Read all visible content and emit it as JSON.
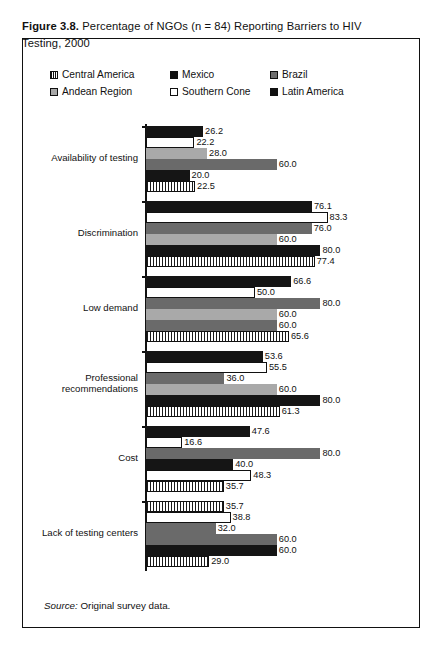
{
  "figure": {
    "number": "Figure 3.8.",
    "caption": "Percentage of NGOs (n = 84) Reporting Barriers to HIV Testing, 2000",
    "source_label": "Source:",
    "source_text": "Original survey data."
  },
  "legend": {
    "items": [
      {
        "label": "Central America",
        "swatch": "striped-vertical",
        "color": "#1a1a1a"
      },
      {
        "label": "Mexico",
        "swatch": "solid-black",
        "color": "#151515"
      },
      {
        "label": "Brazil",
        "swatch": "solid-dark-gray",
        "color": "#6a6a6a"
      },
      {
        "label": "Andean Region",
        "swatch": "solid-light-gray",
        "color": "#a9a9a9"
      },
      {
        "label": "Southern Cone",
        "swatch": "solid-white",
        "color": "#ffffff"
      },
      {
        "label": "Latin America",
        "swatch": "solid-black",
        "color": "#151515"
      }
    ]
  },
  "chart_data": {
    "type": "bar",
    "orientation": "horizontal",
    "title": "Percentage of NGOs (n = 84) Reporting Barriers to HIV Testing, 2000",
    "xlabel": "",
    "ylabel": "",
    "xlim": [
      0,
      100
    ],
    "grid": false,
    "legend_position": "top",
    "categories": [
      "Availability of testing",
      "Discrimination",
      "Low demand",
      "Professional recommendations",
      "Cost",
      "Lack of testing centers"
    ],
    "series": [
      {
        "name": "Latin America",
        "color": "#151515",
        "pattern": "solid",
        "values": [
          26.2,
          76.1,
          66.6,
          53.6,
          47.6,
          35.7
        ]
      },
      {
        "name": "Southern Cone",
        "color": "#ffffff",
        "pattern": "open",
        "values": [
          22.2,
          83.3,
          50.0,
          55.5,
          16.6,
          38.8
        ]
      },
      {
        "name": "Andean Region",
        "color": "#a9a9a9",
        "pattern": "solid",
        "values": [
          28.0,
          76.0,
          80.0,
          36.0,
          80.0,
          32.0
        ]
      },
      {
        "name": "Brazil",
        "color": "#6a6a6a",
        "pattern": "solid",
        "values": [
          60.0,
          60.0,
          60.0,
          60.0,
          40.0,
          60.0
        ]
      },
      {
        "name": "Mexico",
        "color": "#151515",
        "pattern": "solid",
        "values": [
          20.0,
          80.0,
          60.0,
          80.0,
          48.3,
          60.0
        ]
      },
      {
        "name": "Central America",
        "color": "#1a1a1a",
        "pattern": "stripe",
        "values": [
          22.5,
          77.4,
          65.6,
          61.3,
          35.7,
          29.0
        ]
      }
    ],
    "value_labels": [
      [
        "26.2",
        "22.2",
        "28.0",
        "60.0",
        "20.0",
        "22.5"
      ],
      [
        "76.1",
        "83.3",
        "76.0",
        "60.0",
        "80.0",
        "77.4"
      ],
      [
        "66.6",
        "50.0",
        "80.0",
        "60.0",
        "60.0",
        "65.6"
      ],
      [
        "53.6",
        "55.5",
        "36.0",
        "60.0",
        "80.0",
        "61.3"
      ],
      [
        "47.6",
        "16.6",
        "80.0",
        "40.0",
        "48.3",
        "35.7"
      ],
      [
        "35.7",
        "38.8",
        "32.0",
        "60.0",
        "60.0",
        "29.0"
      ]
    ],
    "bar_styles": [
      [
        "b-black",
        "b-white",
        "b-lgray",
        "b-dgray",
        "b-black",
        "b-stripe"
      ],
      [
        "b-black",
        "b-white",
        "b-dgray",
        "b-lgray",
        "b-black",
        "b-stripe"
      ],
      [
        "b-black",
        "b-white",
        "b-dgray",
        "b-lgray",
        "b-dgray",
        "b-stripe"
      ],
      [
        "b-black",
        "b-white",
        "b-dgray",
        "b-lgray",
        "b-black",
        "b-stripe"
      ],
      [
        "b-black",
        "b-white",
        "b-dgray",
        "b-black",
        "b-white",
        "b-stripe"
      ],
      [
        "b-stripe",
        "b-white",
        "b-dgray",
        "b-dgray",
        "b-black",
        "b-stripe"
      ]
    ]
  }
}
